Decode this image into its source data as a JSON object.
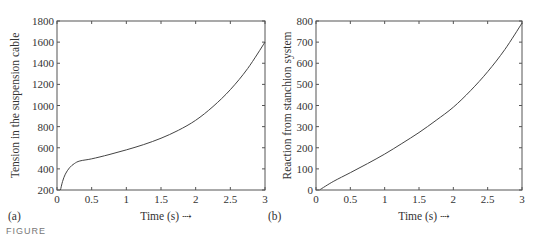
{
  "figure_caption_partial": "FIGURE",
  "chart_data": [
    {
      "panel": "(a)",
      "type": "line",
      "title": "",
      "xlabel": "Time (s) ⇢",
      "ylabel": "Tension in the suspension cable",
      "xlim": [
        0,
        3
      ],
      "ylim": [
        200,
        1800
      ],
      "xticks": [
        "0",
        "0.5",
        "1",
        "1.5",
        "2",
        "2.5",
        "3"
      ],
      "yticks": [
        "200",
        "400",
        "600",
        "800",
        "1000",
        "1200",
        "1400",
        "1600",
        "1800"
      ],
      "grid": false,
      "legend": null,
      "series": [
        {
          "name": "tension",
          "x": [
            0.05,
            0.08,
            0.12,
            0.18,
            0.25,
            0.33,
            0.5,
            0.75,
            1.0,
            1.25,
            1.5,
            1.75,
            2.0,
            2.25,
            2.5,
            2.75,
            3.0
          ],
          "y": [
            200,
            280,
            350,
            410,
            450,
            475,
            495,
            535,
            580,
            630,
            690,
            765,
            860,
            990,
            1150,
            1350,
            1600
          ]
        }
      ]
    },
    {
      "panel": "(b)",
      "type": "line",
      "title": "",
      "xlabel": "Time (s) ⇢",
      "ylabel": "Reaction from stanchion system",
      "xlim": [
        0,
        3
      ],
      "ylim": [
        0,
        800
      ],
      "xticks": [
        "0",
        "0.5",
        "1",
        "1.5",
        "2",
        "2.5",
        "3"
      ],
      "yticks": [
        "0",
        "100",
        "200",
        "300",
        "400",
        "500",
        "600",
        "700",
        "800"
      ],
      "grid": false,
      "legend": null,
      "series": [
        {
          "name": "reaction",
          "x": [
            0.05,
            0.25,
            0.5,
            0.75,
            1.0,
            1.25,
            1.5,
            1.75,
            2.0,
            2.25,
            2.5,
            2.75,
            3.0
          ],
          "y": [
            0,
            40,
            82,
            125,
            170,
            220,
            272,
            330,
            392,
            470,
            560,
            665,
            790
          ]
        }
      ]
    }
  ]
}
